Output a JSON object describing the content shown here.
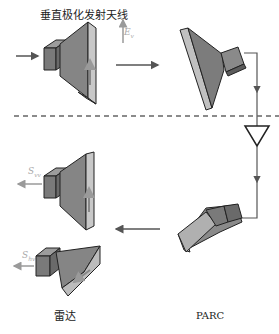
{
  "labels": {
    "tx_antenna": "垂直极化发射天线",
    "radar": "雷达",
    "parc": "PARC"
  },
  "symbols": {
    "incident_field": {
      "base": "E",
      "sub": "v",
      "sup": "i"
    },
    "s_vv": {
      "base": "S",
      "sub": "vv"
    },
    "s_hv": {
      "base": "S",
      "sub": "hv"
    }
  },
  "colors": {
    "horn_dark": "#6e6e6e",
    "horn_mid": "#8c8c8c",
    "horn_light": "#c8c8c8",
    "line": "#555555",
    "arrow_faint": "#9a9a9a"
  }
}
